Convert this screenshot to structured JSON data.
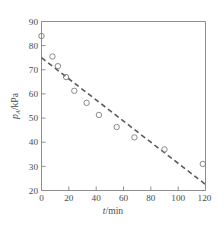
{
  "chart_data": {
    "type": "scatter",
    "title": "",
    "xlabel": "t/min",
    "ylabel": "p_A/kPa",
    "ylabel_parts": {
      "symbol": "p",
      "subscript": "A",
      "unit": "/kPa"
    },
    "xlabel_parts": {
      "symbol": "t",
      "unit": "/min"
    },
    "xlim": [
      0,
      120
    ],
    "ylim": [
      20,
      90
    ],
    "xticks": [
      0,
      20,
      40,
      60,
      80,
      100,
      120
    ],
    "yticks": [
      20,
      30,
      40,
      50,
      60,
      70,
      80,
      90
    ],
    "xtick_labels": [
      "0",
      "20",
      "40",
      "60",
      "80",
      "100",
      "120"
    ],
    "ytick_labels": [
      "20",
      "30",
      "40",
      "50",
      "60",
      "70",
      "80",
      "90"
    ],
    "grid": false,
    "legend": false,
    "frame": "box",
    "marker_style": "open-circle",
    "series": [
      {
        "name": "measured",
        "type": "scatter",
        "x": [
          0,
          8,
          12,
          18,
          24,
          33,
          42,
          55,
          68,
          90,
          118
        ],
        "y": [
          84,
          75.5,
          71.5,
          67,
          61.3,
          56.3,
          51.3,
          46.3,
          42,
          37,
          31
        ]
      },
      {
        "name": "fitted-dashed-line",
        "type": "line",
        "style": "dashed",
        "x": [
          0,
          120
        ],
        "y": [
          75,
          22.5
        ]
      }
    ]
  },
  "axis_colors": {
    "frame": "#8d8d8d",
    "marker": "#7d7d7d",
    "trend": "#5a5a5a",
    "text": "#4a4a4a"
  }
}
